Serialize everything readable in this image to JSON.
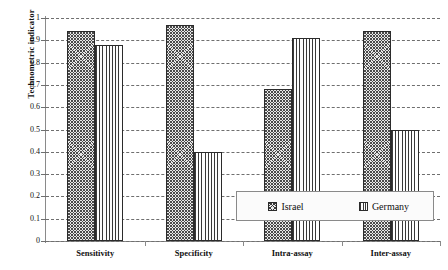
{
  "chart_data": {
    "type": "bar",
    "title": "",
    "xlabel": "",
    "ylabel": "Technometric indicator",
    "categories": [
      "Sensitivity",
      "Specificity",
      "Intra-assay",
      "Inter-assay"
    ],
    "series": [
      {
        "name": "Israel",
        "values": [
          0.94,
          0.97,
          0.68,
          0.94
        ],
        "pattern": "cross-hatch"
      },
      {
        "name": "Germany",
        "values": [
          0.88,
          0.4,
          0.91,
          0.5
        ],
        "pattern": "vertical-lines"
      }
    ],
    "ylim": [
      0,
      1
    ],
    "ytick_labels": [
      "0",
      "0.1",
      "0.2",
      "0.3",
      "0.4",
      "0.5",
      "0.6",
      "0.7",
      "0.8",
      "0.9",
      "1"
    ],
    "ytick_values": [
      0,
      0.1,
      0.2,
      0.3,
      0.4,
      0.5,
      0.6,
      0.7,
      0.8,
      0.9,
      1
    ],
    "grid": "horizontal-dashed",
    "legend_position": "lower-right-inside"
  },
  "legend": {
    "entries": [
      {
        "label": "Israel"
      },
      {
        "label": "Germany"
      }
    ]
  }
}
